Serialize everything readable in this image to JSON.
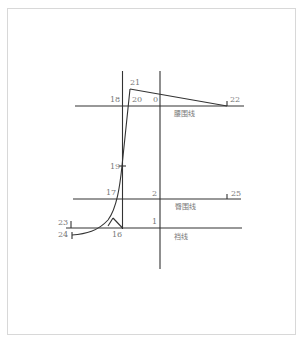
{
  "diagram": {
    "type": "pattern-draft",
    "lines": {
      "waist": "腰围线",
      "hip": "臀围线",
      "crotch": "裆线"
    },
    "points": {
      "p0": "0",
      "p1": "1",
      "p2": "2",
      "p16": "16",
      "p17": "17",
      "p18": "18",
      "p19": "19",
      "p20": "20",
      "p21": "21",
      "p22": "22",
      "p23": "23",
      "p24": "24",
      "p25": "25"
    },
    "colors": {
      "line": "#333333",
      "text": "#777777",
      "border": "#d8d8d8"
    }
  }
}
